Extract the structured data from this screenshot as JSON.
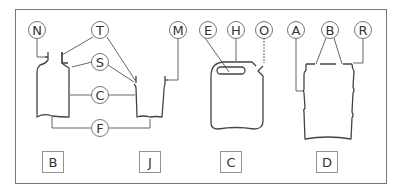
{
  "diagram": {
    "callouts": [
      {
        "id": "N",
        "label": "N"
      },
      {
        "id": "T",
        "label": "T"
      },
      {
        "id": "S",
        "label": "S"
      },
      {
        "id": "C",
        "label": "C"
      },
      {
        "id": "F",
        "label": "F"
      },
      {
        "id": "M",
        "label": "M"
      },
      {
        "id": "E",
        "label": "E"
      },
      {
        "id": "H",
        "label": "H"
      },
      {
        "id": "O",
        "label": "O"
      },
      {
        "id": "A",
        "label": "A"
      },
      {
        "id": "B",
        "label": "B"
      },
      {
        "id": "R",
        "label": "R"
      }
    ],
    "figures": [
      {
        "id": "B",
        "label": "B"
      },
      {
        "id": "J",
        "label": "J"
      },
      {
        "id": "C",
        "label": "C"
      },
      {
        "id": "D",
        "label": "D"
      }
    ]
  }
}
